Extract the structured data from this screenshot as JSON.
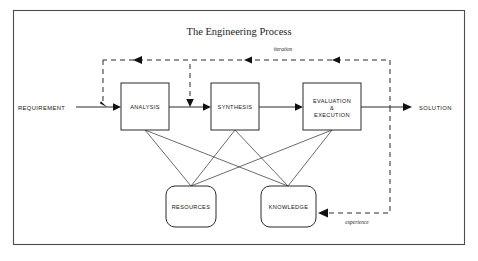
{
  "diagram": {
    "title": "The Engineering Process",
    "frame": {
      "x": 13,
      "y": 10,
      "width": 452,
      "height": 235
    },
    "background_color": "#ffffff",
    "line_color": "#2b2b2b",
    "frame_color": "#4c4c4c",
    "process_boxes": [
      {
        "id": "analysis",
        "label": "ANALYSIS",
        "x": 121,
        "y": 83,
        "width": 48,
        "height": 47
      },
      {
        "id": "synthesis",
        "label": "SYNTHESIS",
        "x": 211,
        "y": 83,
        "width": 48,
        "height": 47
      },
      {
        "id": "evaluation",
        "label_line1": "EVALUATION",
        "label_line2": "&",
        "label_line3": "EXECUTION",
        "x": 303,
        "y": 83,
        "width": 58,
        "height": 47
      }
    ],
    "resource_boxes": [
      {
        "id": "resources",
        "label": "RESOURCES",
        "x": 166,
        "y": 186,
        "width": 50,
        "height": 41
      },
      {
        "id": "knowledge",
        "label": "KNOWLEDGE",
        "x": 261,
        "y": 186,
        "width": 55,
        "height": 41
      }
    ],
    "terminals": {
      "input_label": "REQUIREMENT",
      "output_label": "SOLUTION"
    },
    "feedback_labels": {
      "top": "iteration",
      "bottom": "experience"
    },
    "flow_sequence": [
      "REQUIREMENT",
      "ANALYSIS",
      "SYNTHESIS",
      "EVALUATION & EXECUTION",
      "SOLUTION"
    ],
    "support_links": [
      {
        "from": "ANALYSIS",
        "to": "RESOURCES"
      },
      {
        "from": "ANALYSIS",
        "to": "KNOWLEDGE"
      },
      {
        "from": "SYNTHESIS",
        "to": "RESOURCES"
      },
      {
        "from": "SYNTHESIS",
        "to": "KNOWLEDGE"
      },
      {
        "from": "EVALUATION & EXECUTION",
        "to": "RESOURCES"
      },
      {
        "from": "EVALUATION & EXECUTION",
        "to": "KNOWLEDGE"
      }
    ],
    "feedback_loops": [
      {
        "name": "iteration",
        "from": "EVALUATION & EXECUTION",
        "to": [
          "ANALYSIS",
          "SYNTHESIS"
        ],
        "style": "dashed"
      },
      {
        "name": "experience",
        "from": "EVALUATION & EXECUTION",
        "to": "KNOWLEDGE",
        "style": "dashed"
      }
    ]
  }
}
